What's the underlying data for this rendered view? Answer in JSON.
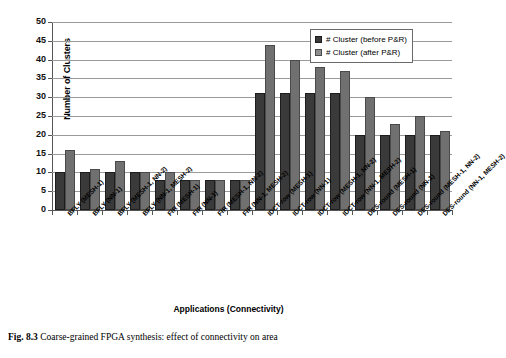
{
  "figure": {
    "caption_number": "Fig. 8.3",
    "caption_text": "Coarse-grained FPGA synthesis: effect of connectivity on area"
  },
  "chart_data": {
    "type": "bar",
    "title": "",
    "xlabel": "Applications (Connectivity)",
    "ylabel": "Number of Clusters",
    "ylim": [
      0,
      50
    ],
    "ytick_step": 5,
    "yticks": [
      "50",
      "45",
      "40",
      "35",
      "30",
      "25",
      "20",
      "15",
      "10",
      "5",
      "0"
    ],
    "grid": true,
    "legend_position": "top-right",
    "categories": [
      "BFLY (MESH-1)",
      "BFLY (NN-1)",
      "BFLY (MESH-1, NN-2)",
      "BFLY (NN-1, MESH-2)",
      "FIR (MESH-1)",
      "FIR (NN-1)",
      "FIR (MESH-1, NN-2)",
      "FIR (NN-1, MESH-2)",
      "IDCT-row (MESH-1)",
      "IDCT-row (NN-1)",
      "IDCT-row (MESH-1, NN-2)",
      "IDCT-row (NN-1, MESH-2)",
      "DES-round (MESH-1)",
      "DES-round (NN-1)",
      "DES-round (MESH-1, NN-2)",
      "DES-round (NN-1, MESH-2)"
    ],
    "series": [
      {
        "name": "# Cluster (before P&R)",
        "color": "#3a3a3a",
        "values": [
          10,
          10,
          10,
          10,
          8,
          8,
          8,
          8,
          31,
          31,
          31,
          31,
          20,
          20,
          20,
          20
        ]
      },
      {
        "name": "# Cluster (after P&R)",
        "color": "#707070",
        "values": [
          16,
          11,
          13,
          10,
          10,
          8,
          8,
          8,
          44,
          40,
          38,
          37,
          30,
          23,
          25,
          21
        ]
      }
    ]
  }
}
